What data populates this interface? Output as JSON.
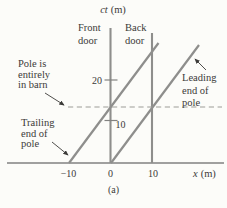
{
  "colors": {
    "background": "#fcfcf9",
    "world_line": "#8e8e8c",
    "axis_line": "#828280",
    "dashed_line": "#9b9b98",
    "arrow": "#3b3a38",
    "text": "#3b3a38"
  },
  "axes": {
    "y_label_var": "ct",
    "y_label_unit": "(m)",
    "x_label_var": "x",
    "x_label_unit": "(m)",
    "y_tick_20": "20",
    "y_tick_10": "10",
    "x_tick_neg10": "−10",
    "x_tick_0": "0",
    "x_tick_10": "10"
  },
  "labels": {
    "front_door": {
      "line1": "Front",
      "line2": "door"
    },
    "back_door": {
      "line1": "Back",
      "line2": "door"
    },
    "pole_in_barn": {
      "line1": "Pole is",
      "line2": "entirely",
      "line3": "in barn"
    },
    "trailing_end": {
      "line1": "Trailing",
      "line2": "end of",
      "line3": "pole"
    },
    "leading_end": {
      "line1": "Leading",
      "line2": "end of",
      "line3": "pole"
    }
  },
  "caption": "(a)",
  "diagram_data": {
    "type": "line",
    "description_visible": "Spacetime diagram: worldlines of barn doors and pole ends",
    "xlabel": "x (m)",
    "ylabel": "ct (m)",
    "x_ticks": [
      -10,
      0,
      10
    ],
    "y_ticks": [
      10,
      20
    ],
    "xlim": [
      -24.5,
      27
    ],
    "ylim": [
      0,
      33
    ],
    "series": [
      {
        "name": "Front door",
        "style": "solid-vertical",
        "points": [
          [
            0,
            0
          ],
          [
            0,
            32.3
          ]
        ]
      },
      {
        "name": "Back door",
        "style": "solid-vertical",
        "points": [
          [
            10,
            0
          ],
          [
            10,
            31.3
          ]
        ]
      },
      {
        "name": "Trailing end of pole",
        "style": "solid",
        "points": [
          [
            -10,
            0
          ],
          [
            11.4,
            28.9
          ]
        ]
      },
      {
        "name": "Leading end of pole",
        "style": "solid",
        "points": [
          [
            0,
            0
          ],
          [
            21.1,
            28.4
          ]
        ]
      },
      {
        "name": "Pole is entirely in barn",
        "style": "dashed-horizontal",
        "points": [
          [
            -10.1,
            13.5
          ],
          [
            26.5,
            13.5
          ]
        ]
      }
    ]
  }
}
